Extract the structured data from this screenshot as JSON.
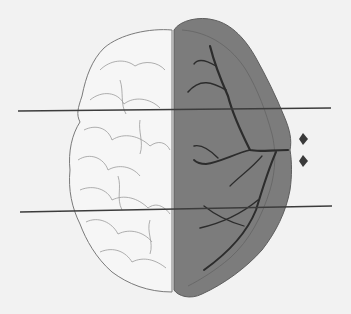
{
  "diagram": {
    "left_hemisphere": {
      "style": "outline",
      "fill": "#f4f4f4",
      "stroke": "#7a7a7a"
    },
    "right_hemisphere": {
      "style": "shaded",
      "fill": "#7c7c7c",
      "stroke": "#5a5a5a",
      "vessel_color": "#2a2a2a"
    },
    "section_lines": {
      "count": 2,
      "color": "#3a3a3a"
    },
    "markers": {
      "count": 2,
      "shape": "diamond",
      "color": "#3a3a3a"
    },
    "background": "#f2f2f2"
  }
}
